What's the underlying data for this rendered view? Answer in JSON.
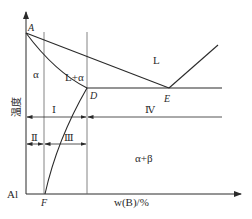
{
  "diagram": {
    "type": "binary eutectic phase diagram",
    "y_axis_label": "温度",
    "x_axis_label": "w(B)/%",
    "origin_label": "Al",
    "points": {
      "A": "A",
      "D": "D",
      "E": "E",
      "F": "F"
    },
    "regions": {
      "liquid": "L",
      "liquid_alpha": "L+α",
      "alpha": "α",
      "alpha_beta": "α+β"
    },
    "zones": {
      "I": "Ⅰ",
      "II": "Ⅱ",
      "III": "Ⅲ",
      "IV": "Ⅳ"
    },
    "colors": {
      "line": "#2a2a2a",
      "guide": "#555555",
      "background": "#ffffff"
    }
  }
}
